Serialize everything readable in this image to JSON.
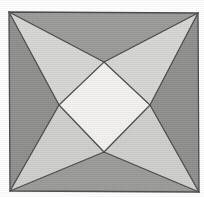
{
  "figure": {
    "title": "Four-pointed star inscribed in a square",
    "canvas": {
      "width": 204,
      "height": 197,
      "background_color": "#ffffff"
    },
    "square": {
      "label": "outer-square",
      "corners": {
        "top_left": {
          "x": 9,
          "y": 12
        },
        "top_right": {
          "x": 198,
          "y": 13
        },
        "bottom_right": {
          "x": 199,
          "y": 192
        },
        "bottom_left": {
          "x": 10,
          "y": 191
        }
      },
      "stroke_color": "#4a4a4a",
      "stroke_width": 1.2
    },
    "center_diamond": {
      "label": "center-diamond",
      "fill_color": "#f3f2ef",
      "vertices": {
        "top": {
          "x": 104,
          "y": 62
        },
        "right": {
          "x": 150,
          "y": 105
        },
        "bottom": {
          "x": 104,
          "y": 152
        },
        "left": {
          "x": 59,
          "y": 105
        }
      }
    },
    "regions": [
      {
        "name": "star-point-top-left",
        "fill_color": "#d6d6d2",
        "role": "light-star-wedge"
      },
      {
        "name": "star-point-top-right",
        "fill_color": "#d6d6d2",
        "role": "light-star-wedge"
      },
      {
        "name": "star-point-bottom-left",
        "fill_color": "#cfcfcb",
        "role": "light-star-wedge"
      },
      {
        "name": "star-point-bottom-right",
        "fill_color": "#cfcfcb",
        "role": "light-star-wedge"
      },
      {
        "name": "wedge-top",
        "fill_color": "#9b9b99",
        "role": "mid-gray-wedge"
      },
      {
        "name": "wedge-bottom",
        "fill_color": "#9b9b99",
        "role": "mid-gray-wedge"
      },
      {
        "name": "wedge-left",
        "fill_color": "#8f8f8d",
        "role": "dark-gray-wedge"
      },
      {
        "name": "wedge-right",
        "fill_color": "#8f8f8d",
        "role": "dark-gray-wedge"
      }
    ],
    "line_color": "#4a4a4a",
    "palette": {
      "background": "#ffffff",
      "lightest": "#f3f2ef",
      "light_gray": "#d6d6d2",
      "mid_gray": "#9b9b99",
      "dark_gray": "#8f8f8d",
      "outline": "#4a4a4a"
    }
  }
}
